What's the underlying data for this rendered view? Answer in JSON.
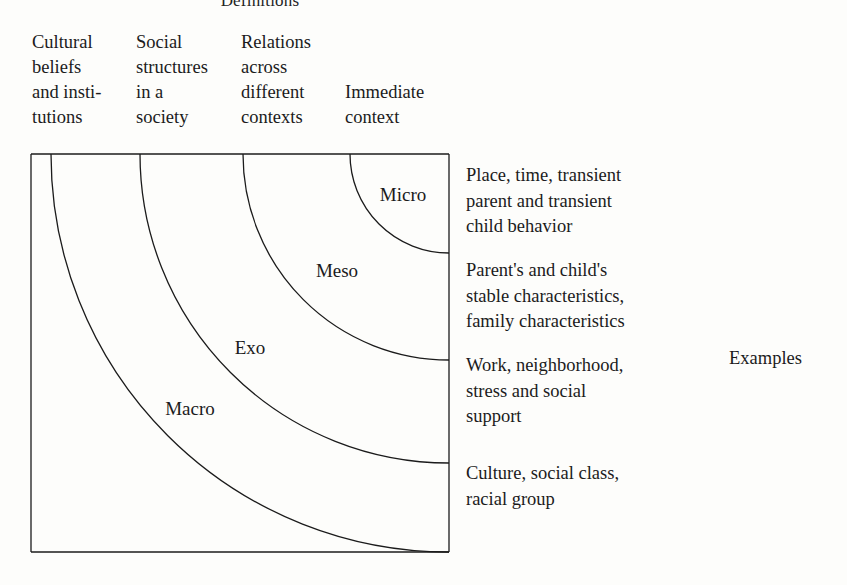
{
  "page": {
    "title": "Definitions",
    "width": 847,
    "height": 585,
    "background_color": "#fdfdfb",
    "ink_color": "#1b1b1b"
  },
  "definitions_header": {
    "columns": [
      {
        "name": "macro",
        "lines": [
          "Cultural",
          "beliefs",
          "and insti-",
          "tutions"
        ],
        "x": 32,
        "y": 30
      },
      {
        "name": "exo",
        "lines": [
          "Social",
          "structures",
          "in a",
          "society"
        ],
        "x": 136,
        "y": 30
      },
      {
        "name": "meso",
        "lines": [
          "Relations",
          "across",
          "different",
          "contexts"
        ],
        "x": 241,
        "y": 30
      },
      {
        "name": "micro",
        "lines": [
          "Immediate",
          "context"
        ],
        "x": 345,
        "y": 80
      }
    ]
  },
  "diagram": {
    "type": "nested-quarter-arcs",
    "center": {
      "x": 449,
      "y": 154
    },
    "frame": {
      "left": 31,
      "top": 154,
      "right": 449,
      "bottom": 552
    },
    "rings": [
      {
        "label": "Micro",
        "radius": 99,
        "label_x": 403,
        "label_y": 194
      },
      {
        "label": "Meso",
        "radius": 206,
        "label_x": 337,
        "label_y": 270
      },
      {
        "label": "Exo",
        "radius": 309,
        "label_x": 250,
        "label_y": 347
      },
      {
        "label": "Macro",
        "radius": 398,
        "label_x": 190,
        "label_y": 408
      }
    ]
  },
  "examples": {
    "caption": "Examples",
    "blocks": [
      {
        "name": "micro",
        "lines": [
          "Place, time, transient",
          "parent and transient",
          "child behavior"
        ],
        "y": 163
      },
      {
        "name": "meso",
        "lines": [
          "Parent's and child's",
          "stable characteristics,",
          "family characteristics"
        ],
        "y": 258
      },
      {
        "name": "exo",
        "lines": [
          "Work, neighborhood,",
          "stress and social",
          "support"
        ],
        "y": 353
      },
      {
        "name": "macro",
        "lines": [
          "Culture, social class,",
          "racial group"
        ],
        "y": 461
      }
    ]
  }
}
